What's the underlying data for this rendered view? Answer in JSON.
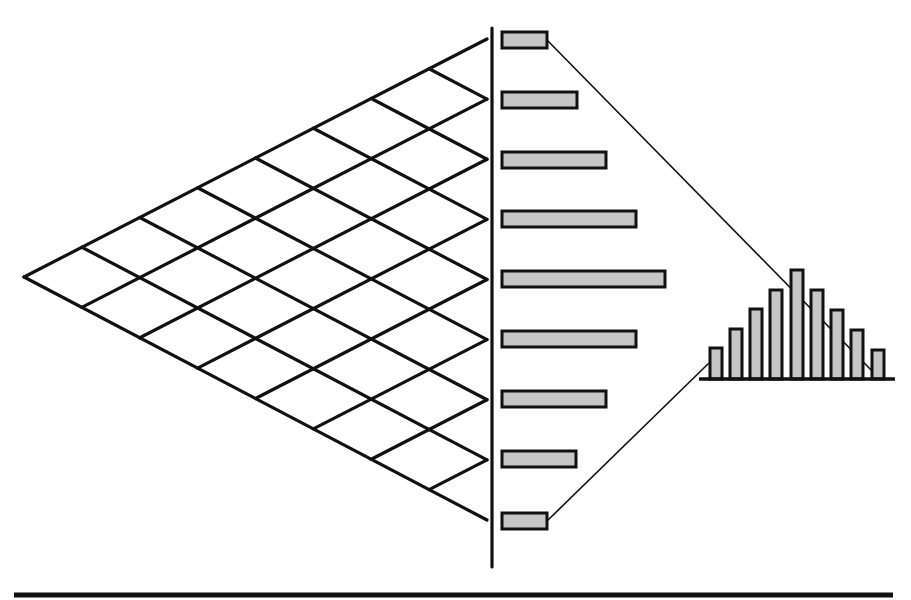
{
  "diagram": {
    "title": "",
    "colors": {
      "line": "#111111",
      "bar_fill": "#c6c6c6",
      "background": "#ffffff"
    },
    "lattice": {
      "apex": [
        24,
        277
      ],
      "top_right": [
        487,
        39
      ],
      "bottom_right": [
        487,
        520
      ],
      "levels": 8
    },
    "divider": {
      "x": 492,
      "y_top": 28,
      "y_bottom": 567
    },
    "baseline_rule": {
      "x1": 14,
      "x2": 893,
      "y": 595
    },
    "horizontal_bars": {
      "x_left": 502,
      "height": 16,
      "items": [
        {
          "y_center": 40,
          "x_right": 547
        },
        {
          "y_center": 100,
          "x_right": 577
        },
        {
          "y_center": 160,
          "x_right": 606
        },
        {
          "y_center": 219,
          "x_right": 636
        },
        {
          "y_center": 279,
          "x_right": 665
        },
        {
          "y_center": 339,
          "x_right": 636
        },
        {
          "y_center": 399,
          "x_right": 606
        },
        {
          "y_center": 459,
          "x_right": 576
        },
        {
          "y_center": 521,
          "x_right": 547
        }
      ]
    },
    "histogram": {
      "baseline": {
        "x1": 699,
        "x2": 895,
        "y": 379
      },
      "bar_width": 12,
      "bars": [
        {
          "x_center": 716,
          "top": 348
        },
        {
          "x_center": 736,
          "top": 329
        },
        {
          "x_center": 756,
          "top": 309
        },
        {
          "x_center": 776,
          "top": 290
        },
        {
          "x_center": 797,
          "top": 270
        },
        {
          "x_center": 817,
          "top": 290
        },
        {
          "x_center": 837,
          "top": 310
        },
        {
          "x_center": 857,
          "top": 330
        },
        {
          "x_center": 878,
          "top": 350
        }
      ]
    },
    "connectors": [
      {
        "from": [
          547,
          40
        ],
        "to": [
          878,
          377
        ]
      },
      {
        "from": [
          547,
          521
        ],
        "to": [
          709,
          363
        ]
      }
    ]
  },
  "chart_data": {
    "type": "bar",
    "title": "",
    "xlabel": "",
    "ylabel": "",
    "categories": [
      "1",
      "2",
      "3",
      "4",
      "5",
      "6",
      "7",
      "8",
      "9"
    ],
    "series": [
      {
        "name": "horizontal bars (relative length)",
        "values": [
          1,
          2,
          3,
          4,
          5,
          4,
          3,
          2,
          1
        ]
      },
      {
        "name": "histogram (relative height)",
        "values": [
          1,
          2,
          3,
          4,
          5,
          4,
          3,
          2,
          1
        ]
      }
    ],
    "grid": false,
    "legend": "none"
  }
}
